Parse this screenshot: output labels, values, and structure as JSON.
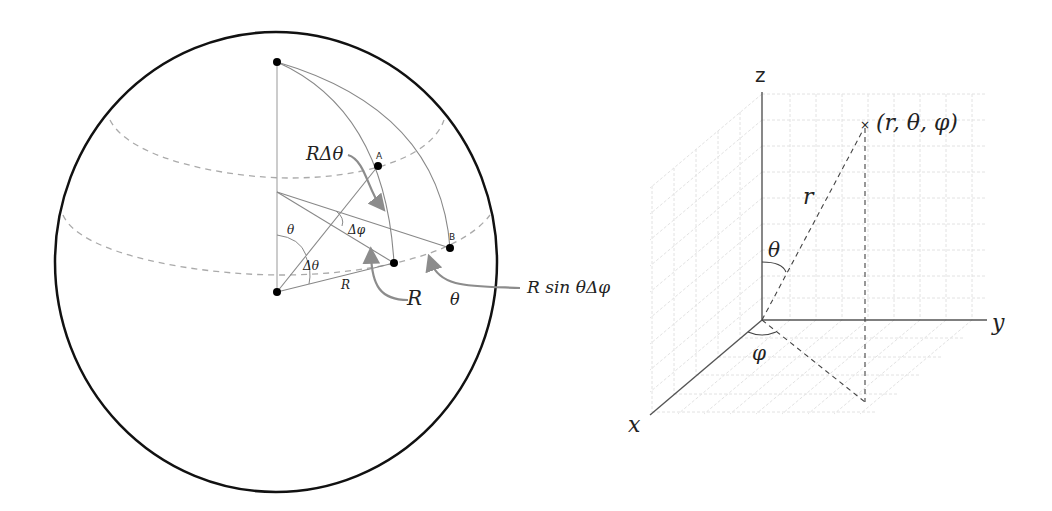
{
  "left_figure": {
    "name": "sphere-surface-element",
    "labels": {
      "r_delta_theta": "RΔθ",
      "point_a": "A",
      "point_b": "B",
      "delta_phi": "Δφ",
      "theta_angle": "θ",
      "delta_theta_angle": "Δθ",
      "radius_small": "R",
      "radius_callout": "R",
      "theta_callout": "θ",
      "r_sin_theta_delta_phi": "R sin θΔφ"
    },
    "colors": {
      "sphere_outline": "#111111",
      "construction_lines": "#888888",
      "dashed_latitudes": "#aaaaaa",
      "callout_arrows": "#8c8c8c",
      "points": "#000000"
    }
  },
  "right_figure": {
    "name": "spherical-coordinates-axes",
    "labels": {
      "z_axis": "z",
      "y_axis": "y",
      "x_axis": "x",
      "radius": "r",
      "polar_angle": "θ",
      "azimuth_angle": "φ",
      "point": "(r, θ, φ)",
      "point_marker": "×"
    },
    "colors": {
      "axes": "#555555",
      "grid": "#dddddd",
      "dashed": "#444444"
    }
  }
}
